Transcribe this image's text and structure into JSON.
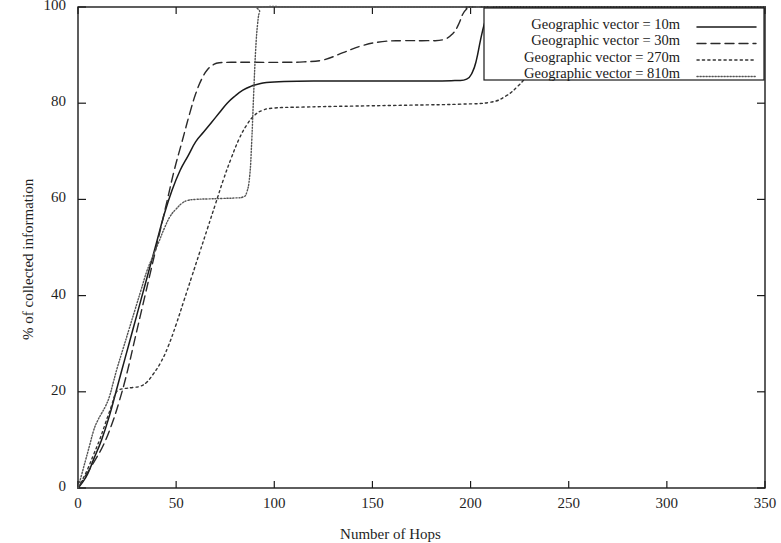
{
  "chart_data": {
    "type": "line",
    "title": "",
    "xlabel": "Number of Hops",
    "ylabel": "% of collected information",
    "xlim": [
      0,
      350
    ],
    "ylim": [
      0,
      100
    ],
    "xticks": [
      0,
      50,
      100,
      150,
      200,
      250,
      300,
      350
    ],
    "yticks": [
      0,
      20,
      40,
      60,
      80,
      100
    ],
    "xtick_labels": [
      "0",
      "50",
      "100",
      "150",
      "200",
      "250",
      "300",
      "350"
    ],
    "ytick_labels": [
      "0",
      "20",
      "40",
      "60",
      "80",
      "100"
    ],
    "grid": false,
    "legend_position": "top-right",
    "frame": true,
    "series": [
      {
        "name": "Geographic vector = 10m",
        "style": "solid",
        "color": "#1a1a1a",
        "points": [
          [
            0,
            0
          ],
          [
            2,
            1
          ],
          [
            5,
            3
          ],
          [
            8,
            6
          ],
          [
            12,
            10
          ],
          [
            16,
            15
          ],
          [
            20,
            21
          ],
          [
            24,
            27
          ],
          [
            28,
            33
          ],
          [
            32,
            39
          ],
          [
            36,
            45
          ],
          [
            40,
            51
          ],
          [
            44,
            57
          ],
          [
            48,
            62
          ],
          [
            52,
            66
          ],
          [
            56,
            69
          ],
          [
            60,
            72
          ],
          [
            64,
            74
          ],
          [
            68,
            76
          ],
          [
            72,
            78
          ],
          [
            76,
            80
          ],
          [
            80,
            81.5
          ],
          [
            84,
            82.7
          ],
          [
            88,
            83.5
          ],
          [
            92,
            84
          ],
          [
            96,
            84.3
          ],
          [
            105,
            84.5
          ],
          [
            120,
            84.6
          ],
          [
            140,
            84.6
          ],
          [
            160,
            84.6
          ],
          [
            180,
            84.6
          ],
          [
            192,
            84.7
          ],
          [
            198,
            85
          ],
          [
            201,
            86.5
          ],
          [
            203,
            89
          ],
          [
            205,
            93
          ],
          [
            207,
            96.5
          ],
          [
            209,
            98.8
          ],
          [
            211,
            99.7
          ],
          [
            214,
            100
          ],
          [
            240,
            100
          ],
          [
            280,
            100
          ],
          [
            320,
            100
          ],
          [
            350,
            100
          ]
        ]
      },
      {
        "name": "Geographic vector = 30m",
        "style": "dashed",
        "color": "#2a2a2a",
        "points": [
          [
            0,
            0
          ],
          [
            3,
            2
          ],
          [
            6,
            4
          ],
          [
            9,
            6
          ],
          [
            13,
            9
          ],
          [
            17,
            13
          ],
          [
            21,
            18
          ],
          [
            25,
            24
          ],
          [
            29,
            31
          ],
          [
            33,
            38
          ],
          [
            37,
            45
          ],
          [
            41,
            52
          ],
          [
            45,
            59
          ],
          [
            49,
            66
          ],
          [
            53,
            72
          ],
          [
            57,
            78
          ],
          [
            60,
            82
          ],
          [
            63,
            85
          ],
          [
            66,
            87
          ],
          [
            69,
            88
          ],
          [
            72,
            88.4
          ],
          [
            78,
            88.5
          ],
          [
            90,
            88.5
          ],
          [
            105,
            88.5
          ],
          [
            115,
            88.6
          ],
          [
            125,
            89
          ],
          [
            135,
            90.5
          ],
          [
            145,
            92
          ],
          [
            155,
            92.8
          ],
          [
            165,
            93
          ],
          [
            178,
            93
          ],
          [
            186,
            93.2
          ],
          [
            191,
            94.5
          ],
          [
            194,
            96.5
          ],
          [
            196,
            98.5
          ],
          [
            198,
            99.6
          ],
          [
            200,
            100
          ],
          [
            230,
            100
          ],
          [
            270,
            100
          ],
          [
            310,
            100
          ],
          [
            350,
            100
          ]
        ]
      },
      {
        "name": "Geographic vector = 270m",
        "style": "dotted-coarse",
        "color": "#333333",
        "points": [
          [
            0,
            0
          ],
          [
            2,
            1.5
          ],
          [
            5,
            4
          ],
          [
            8,
            7
          ],
          [
            11,
            10
          ],
          [
            14,
            13.5
          ],
          [
            17,
            17
          ],
          [
            19,
            19.5
          ],
          [
            21,
            20.4
          ],
          [
            24,
            20.7
          ],
          [
            28,
            20.9
          ],
          [
            32,
            21.2
          ],
          [
            35,
            22
          ],
          [
            38,
            23.5
          ],
          [
            42,
            26
          ],
          [
            46,
            29.5
          ],
          [
            50,
            34
          ],
          [
            54,
            39
          ],
          [
            58,
            44
          ],
          [
            62,
            49
          ],
          [
            66,
            54
          ],
          [
            70,
            59
          ],
          [
            74,
            64
          ],
          [
            78,
            68.5
          ],
          [
            82,
            72.5
          ],
          [
            86,
            75.5
          ],
          [
            90,
            77.5
          ],
          [
            94,
            78.5
          ],
          [
            100,
            79
          ],
          [
            115,
            79.2
          ],
          [
            140,
            79.4
          ],
          [
            170,
            79.6
          ],
          [
            195,
            79.8
          ],
          [
            210,
            80.2
          ],
          [
            218,
            81.5
          ],
          [
            224,
            83.5
          ],
          [
            230,
            86
          ],
          [
            238,
            88.5
          ],
          [
            246,
            90.5
          ],
          [
            254,
            92
          ],
          [
            262,
            93
          ],
          [
            270,
            93.7
          ],
          [
            278,
            94
          ],
          [
            286,
            94.2
          ],
          [
            291,
            95
          ],
          [
            294,
            96.5
          ],
          [
            297,
            98.3
          ],
          [
            299,
            99.4
          ],
          [
            301,
            100
          ],
          [
            320,
            100
          ],
          [
            350,
            100
          ]
        ]
      },
      {
        "name": "Geographic vector = 810m",
        "style": "dotted-fine",
        "color": "#555555",
        "points": [
          [
            0,
            0
          ],
          [
            2,
            3
          ],
          [
            4,
            6
          ],
          [
            6,
            9
          ],
          [
            8,
            12
          ],
          [
            10,
            14
          ],
          [
            12,
            15.5
          ],
          [
            14,
            17
          ],
          [
            16,
            19
          ],
          [
            18,
            22
          ],
          [
            20,
            25
          ],
          [
            23,
            29
          ],
          [
            26,
            33
          ],
          [
            29,
            37
          ],
          [
            32,
            41
          ],
          [
            35,
            45
          ],
          [
            38,
            48
          ],
          [
            41,
            51
          ],
          [
            44,
            54
          ],
          [
            47,
            56.5
          ],
          [
            50,
            58
          ],
          [
            53,
            59.2
          ],
          [
            56,
            59.8
          ],
          [
            60,
            60
          ],
          [
            66,
            60.1
          ],
          [
            74,
            60.2
          ],
          [
            80,
            60.3
          ],
          [
            84,
            60.5
          ],
          [
            86,
            61.5
          ],
          [
            87.5,
            65
          ],
          [
            88.5,
            72
          ],
          [
            89.5,
            82
          ],
          [
            90.5,
            91
          ],
          [
            91.5,
            96.5
          ],
          [
            92.5,
            99
          ],
          [
            94,
            100
          ],
          [
            120,
            100
          ],
          [
            180,
            100
          ],
          [
            250,
            100
          ],
          [
            310,
            100
          ],
          [
            350,
            100
          ]
        ]
      }
    ]
  },
  "legend": {
    "entries": [
      {
        "label": "Geographic vector = 10m",
        "style": "solid"
      },
      {
        "label": "Geographic vector = 30m",
        "style": "dashed"
      },
      {
        "label": "Geographic vector = 270m",
        "style": "dotted-coarse"
      },
      {
        "label": "Geographic vector = 810m",
        "style": "dotted-fine"
      }
    ]
  }
}
